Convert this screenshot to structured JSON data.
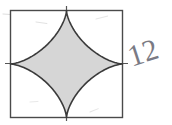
{
  "figure": {
    "title": "Square with inscribed astroid (four-pointed star) shaded",
    "background_color": "#ffffff",
    "square": {
      "name": "outer-square",
      "x": 10.5,
      "y": 10.5,
      "width": 112,
      "height": 107,
      "stroke_color": "#4a4a4a",
      "stroke_width": 1.4,
      "fill": "none"
    },
    "astroid": {
      "name": "astroid-star",
      "center_x": 66.5,
      "center_y": 64,
      "radius_x": 56,
      "radius_y": 53.5,
      "fill_color": "#d6d6d6",
      "stroke_color": "#3a3a3a",
      "stroke_width": 1.6,
      "cusps": 4,
      "description": "concave four-pointed star whose cusps touch the midpoints of the square's sides"
    },
    "center_lines": {
      "name": "center-cross-lines",
      "stroke_color": "#555555",
      "stroke_width": 1.2,
      "horizontal": {
        "x1": 5,
        "y1": 63.5,
        "x2": 128,
        "y2": 63.5
      },
      "vertical": {
        "x1": 66.5,
        "y1": 6,
        "x2": 66.5,
        "y2": 121
      }
    },
    "annotation": {
      "name": "handwritten-number",
      "text": "12",
      "x": 146,
      "y": 62,
      "rotation_deg": -18,
      "color": "#7a7a84",
      "font_size": 30
    },
    "stray_marks": [
      {
        "name": "stray-mark-top-left",
        "x": 36,
        "y": 22,
        "rotation_deg": 8,
        "length": 11,
        "opacity": 0.26
      },
      {
        "name": "stray-mark-top-right",
        "x": 96,
        "y": 19,
        "rotation_deg": -14,
        "length": 12,
        "opacity": 0.22
      },
      {
        "name": "stray-mark-bottom-left",
        "x": 30,
        "y": 102,
        "rotation_deg": -4,
        "length": 8,
        "opacity": 0.2
      },
      {
        "name": "stray-mark-bottom-right",
        "x": 90,
        "y": 112,
        "rotation_deg": -22,
        "length": 9,
        "opacity": 0.22
      },
      {
        "name": "stray-mark-left-edge",
        "x": 3,
        "y": 14,
        "rotation_deg": 4,
        "length": 7,
        "opacity": 0.3
      }
    ]
  }
}
